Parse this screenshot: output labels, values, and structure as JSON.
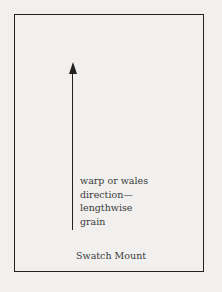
{
  "diagram": {
    "label_lines": [
      "warp or wales",
      "direction—",
      "lengthwise",
      "grain"
    ],
    "caption": "Swatch Mount",
    "arrow": {
      "direction": "up",
      "icon": "arrow-up-icon"
    }
  }
}
